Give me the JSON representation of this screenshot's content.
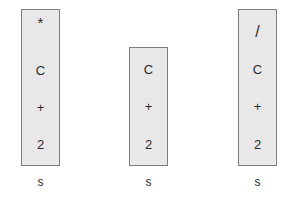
{
  "diagram": {
    "background_color": "#ffffff",
    "box_fill_color": "#e8e8e8",
    "box_border_color": "#7d7d7d",
    "text_color": "#2b2b2b",
    "stacks": [
      {
        "id": "stack-1",
        "label": "s",
        "items": [
          "*",
          "C",
          "+",
          "2"
        ],
        "item_count": 4,
        "left": 21,
        "top": 9,
        "width": 39,
        "height": 157
      },
      {
        "id": "stack-2",
        "label": "s",
        "items": [
          "C",
          "+",
          "2"
        ],
        "item_count": 3,
        "left": 129,
        "top": 47,
        "width": 39,
        "height": 119
      },
      {
        "id": "stack-3",
        "label": "s",
        "items": [
          "/",
          "C",
          "+",
          "2"
        ],
        "item_count": 4,
        "left": 238,
        "top": 9,
        "width": 39,
        "height": 157
      }
    ],
    "label_top": 176
  }
}
